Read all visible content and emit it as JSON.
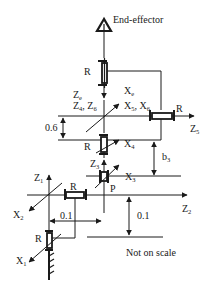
{
  "diagram": {
    "labels": {
      "end_effector": "End-effector",
      "joint_r_top": "R",
      "ze": "Z",
      "ze_sub": "e",
      "xe": "X",
      "xe_sub": "e",
      "z4z6": "Z",
      "z4z6_sub_a": "4",
      "z4z6_sep": ", Z",
      "z4z6_sub_b": "6",
      "x5x6": "X",
      "x5x6_sub_a": "5",
      "x5x6_sep": ", X",
      "x5x6_sub_b": "6",
      "joint_r_z5": "R",
      "z5": "Z",
      "z5_sub": "5",
      "dim_06": "0.6",
      "x4": "X",
      "x4_sub": "4",
      "joint_r_x4": "R",
      "b3": "b",
      "b3_sub": "3",
      "z3": "Z",
      "z3_sub": "3",
      "x3": "X",
      "x3_sub": "3",
      "joint_p": "P",
      "z1": "Z",
      "z1_sub": "1",
      "joint_r_z2": "R",
      "z2": "Z",
      "z2_sub": "2",
      "x2": "X",
      "x2_sub": "2",
      "dim_01_h": "0.1",
      "dim_01_v": "0.1",
      "joint_r_base": "R",
      "x1": "X",
      "x1_sub": "1",
      "note": "Not on scale"
    },
    "colors": {
      "ink": "#1a1a1a",
      "background": "#ffffff"
    }
  }
}
